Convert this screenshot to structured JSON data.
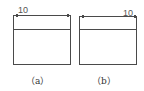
{
  "figures": [
    {
      "id": "a",
      "caption": "（a）",
      "dimension_label": "10",
      "dimension_position": "top-left"
    },
    {
      "id": "b",
      "caption": "（b）",
      "dimension_label": "10",
      "dimension_position": "top-right"
    }
  ],
  "colors": {
    "line": "#4a4a4a",
    "text": "#555555",
    "background": "#ffffff"
  }
}
